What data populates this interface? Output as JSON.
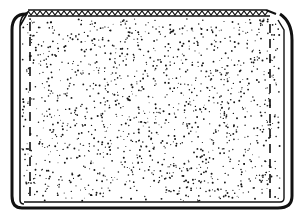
{
  "diagram": {
    "colors": {
      "background": "#ffffff",
      "ink": "#111111"
    },
    "panel": {
      "x": 14,
      "y": 10,
      "width": 276,
      "height": 194,
      "outline_weight": 3
    },
    "top_edge": {
      "style": "zigzag-stitch",
      "y": 12
    },
    "seams": [
      {
        "side": "left",
        "x": 30,
        "style": "dashed"
      },
      {
        "side": "right",
        "x": 270,
        "style": "dashed"
      }
    ],
    "fill": {
      "style": "stipple",
      "dot_count": 1400
    }
  }
}
